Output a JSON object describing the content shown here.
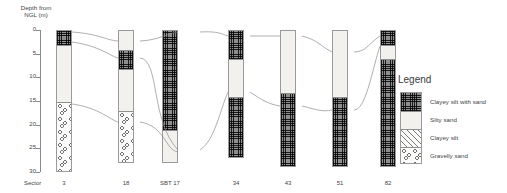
{
  "chart_data": {
    "type": "diagram",
    "title": "",
    "ylabel": "Depth from\nNGL (m)",
    "ylim": [
      0,
      30
    ],
    "y_ticks": [
      "0",
      "5",
      "10",
      "15",
      "20",
      "25",
      "30"
    ],
    "y_direction": "downward",
    "sector_label": "Sector",
    "lithologies": [
      {
        "key": "clayey-silt-with-sand",
        "label": "Clayey silt with sand"
      },
      {
        "key": "silty-sand",
        "label": "Silty sand"
      },
      {
        "key": "clayey-silt",
        "label": "Clayey silt"
      },
      {
        "key": "gravelly-sand",
        "label": "Gravelly sand"
      }
    ],
    "boreholes": [
      {
        "name": "3",
        "total_depth": 30,
        "layers": [
          {
            "lithology": "clayey-silt-with-sand",
            "top": 0,
            "bottom": 3
          },
          {
            "lithology": "silty-sand",
            "top": 3,
            "bottom": 15
          },
          {
            "lithology": "gravelly-sand",
            "top": 15,
            "bottom": 30
          }
        ]
      },
      {
        "name": "18",
        "total_depth": 28,
        "layers": [
          {
            "lithology": "silty-sand",
            "top": 0,
            "bottom": 4
          },
          {
            "lithology": "clayey-silt-with-sand",
            "top": 4,
            "bottom": 8
          },
          {
            "lithology": "silty-sand",
            "top": 8,
            "bottom": 17
          },
          {
            "lithology": "gravelly-sand",
            "top": 17,
            "bottom": 28
          }
        ]
      },
      {
        "name": "SBT 17",
        "total_depth": 28,
        "layers": [
          {
            "lithology": "clayey-silt-with-sand",
            "top": 0,
            "bottom": 21
          },
          {
            "lithology": "silty-sand",
            "top": 21,
            "bottom": 28
          }
        ]
      },
      {
        "name": "34",
        "total_depth": 27,
        "layers": [
          {
            "lithology": "clayey-silt-with-sand",
            "top": 0,
            "bottom": 6
          },
          {
            "lithology": "silty-sand",
            "top": 6,
            "bottom": 14
          },
          {
            "lithology": "clayey-silt-with-sand",
            "top": 14,
            "bottom": 27
          }
        ]
      },
      {
        "name": "43",
        "total_depth": 29,
        "layers": [
          {
            "lithology": "silty-sand",
            "top": 0,
            "bottom": 13
          },
          {
            "lithology": "clayey-silt-with-sand",
            "top": 13,
            "bottom": 29
          }
        ]
      },
      {
        "name": "51",
        "total_depth": 29,
        "layers": [
          {
            "lithology": "silty-sand",
            "top": 0,
            "bottom": 14
          },
          {
            "lithology": "clayey-silt-with-sand",
            "top": 14,
            "bottom": 29
          }
        ]
      },
      {
        "name": "82",
        "total_depth": 29,
        "layers": [
          {
            "lithology": "clayey-silt-with-sand",
            "top": 0,
            "bottom": 3
          },
          {
            "lithology": "silty-sand",
            "top": 3,
            "bottom": 6
          },
          {
            "lithology": "clayey-silt-with-sand",
            "top": 6,
            "bottom": 29
          }
        ]
      }
    ]
  },
  "legend": {
    "title": "Legend"
  }
}
